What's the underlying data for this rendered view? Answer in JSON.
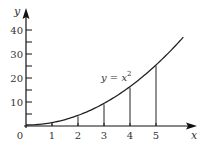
{
  "chart_data": {
    "type": "line",
    "title": "",
    "xlabel": "x",
    "ylabel": "y",
    "xlim": [
      0,
      6.1
    ],
    "ylim": [
      0,
      44
    ],
    "x_ticks": [
      0,
      1,
      2,
      3,
      4,
      5
    ],
    "x_tick_labels": [
      "0",
      "1",
      "2",
      "3",
      "4",
      "5"
    ],
    "y_ticks": [
      10,
      20,
      30,
      40
    ],
    "y_tick_labels": [
      "10",
      "20",
      "30",
      "40"
    ],
    "y_minor_ticks": [
      5,
      15,
      25,
      35
    ],
    "grid": false,
    "legend": "none",
    "series": [
      {
        "name": "y = x^2",
        "function": "x^2",
        "x_range": [
          0,
          6.05
        ],
        "x": [
          0,
          1,
          2,
          3,
          4,
          5,
          6
        ],
        "y": [
          0,
          1,
          4,
          9,
          16,
          25,
          36
        ]
      }
    ],
    "vertical_lines": [
      {
        "x": 1,
        "y": 1
      },
      {
        "x": 2,
        "y": 4
      },
      {
        "x": 3,
        "y": 9
      },
      {
        "x": 4,
        "y": 16
      },
      {
        "x": 5,
        "y": 25
      }
    ],
    "annotations": [
      {
        "text_var": "y",
        "text_eq": " = ",
        "text_base": "x",
        "text_sup": "2",
        "near_x": 3.6
      }
    ],
    "colors": {
      "axis": "#111111",
      "curve": "#222222",
      "text": "#333333"
    }
  }
}
